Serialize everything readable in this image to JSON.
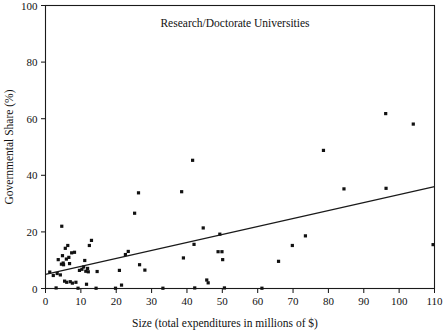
{
  "chart_data": {
    "type": "scatter",
    "title": "Research/Doctorate Universities",
    "xlabel": "Size (total expenditures in millions of $)",
    "ylabel": "Governmental Share (%)",
    "xlim": [
      0,
      110
    ],
    "ylim": [
      0,
      100
    ],
    "xticks": [
      0,
      10,
      20,
      30,
      40,
      50,
      60,
      70,
      80,
      90,
      100,
      110
    ],
    "yticks": [
      0,
      20,
      40,
      60,
      80,
      100
    ],
    "grid": false,
    "legend": "none",
    "marker_style": "filled-square",
    "marker_color": "#111111",
    "points": [
      [
        1.2,
        5.8
      ],
      [
        2.2,
        4.6
      ],
      [
        3.0,
        0.2
      ],
      [
        3.3,
        5.3
      ],
      [
        3.6,
        10.2
      ],
      [
        4.2,
        4.8
      ],
      [
        4.5,
        8.6
      ],
      [
        4.6,
        22.0
      ],
      [
        4.8,
        11.6
      ],
      [
        5.0,
        9.0
      ],
      [
        5.1,
        8.4
      ],
      [
        5.4,
        2.6
      ],
      [
        5.6,
        14.2
      ],
      [
        5.9,
        10.4
      ],
      [
        6.0,
        2.2
      ],
      [
        6.3,
        15.2
      ],
      [
        6.6,
        11.0
      ],
      [
        6.8,
        8.8
      ],
      [
        7.0,
        2.4
      ],
      [
        7.4,
        12.6
      ],
      [
        7.6,
        1.9
      ],
      [
        8.2,
        12.8
      ],
      [
        8.6,
        2.2
      ],
      [
        9.2,
        0.1
      ],
      [
        9.6,
        6.4
      ],
      [
        10.3,
        6.8
      ],
      [
        10.8,
        7.6
      ],
      [
        11.1,
        9.9
      ],
      [
        11.4,
        6.1
      ],
      [
        11.6,
        1.5
      ],
      [
        11.9,
        7.1
      ],
      [
        12.1,
        5.9
      ],
      [
        12.4,
        15.2
      ],
      [
        13.0,
        17.0
      ],
      [
        14.3,
        0.1
      ],
      [
        14.6,
        6.0
      ],
      [
        19.8,
        0.1
      ],
      [
        20.9,
        6.4
      ],
      [
        21.5,
        1.2
      ],
      [
        22.6,
        12.0
      ],
      [
        23.4,
        13.1
      ],
      [
        25.2,
        26.6
      ],
      [
        26.3,
        33.8
      ],
      [
        26.6,
        8.4
      ],
      [
        28.1,
        6.5
      ],
      [
        33.2,
        0.1
      ],
      [
        38.5,
        34.2
      ],
      [
        39.0,
        10.8
      ],
      [
        41.6,
        45.3
      ],
      [
        42.0,
        15.6
      ],
      [
        42.2,
        0.2
      ],
      [
        44.6,
        21.4
      ],
      [
        45.6,
        3.0
      ],
      [
        46.0,
        2.0
      ],
      [
        48.8,
        13.0
      ],
      [
        49.3,
        19.2
      ],
      [
        49.9,
        13.0
      ],
      [
        50.1,
        10.2
      ],
      [
        50.6,
        0.2
      ],
      [
        61.2,
        0.1
      ],
      [
        65.9,
        9.6
      ],
      [
        69.8,
        15.2
      ],
      [
        73.5,
        18.6
      ],
      [
        78.6,
        48.8
      ],
      [
        84.4,
        35.2
      ],
      [
        96.2,
        61.8
      ],
      [
        96.3,
        35.4
      ],
      [
        104.0,
        58.1
      ],
      [
        109.6,
        15.5
      ]
    ],
    "fit_line": {
      "label": "least-squares fit",
      "x_start": 0,
      "y_start": 5.0,
      "x_end": 110,
      "y_end": 36.0
    }
  }
}
